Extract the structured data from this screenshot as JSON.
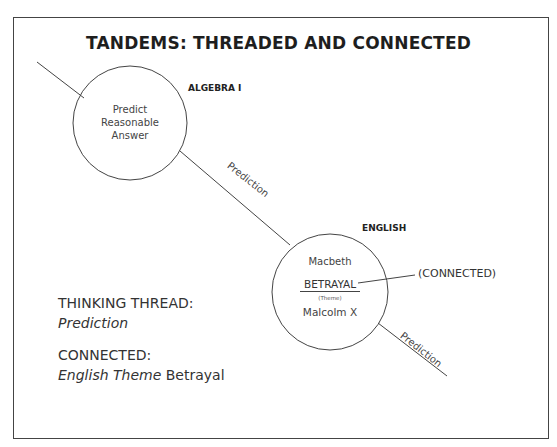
{
  "title": "TANDEMS: THREADED AND CONNECTED",
  "nodes": [
    {
      "subject": "ALGEBRA I",
      "content": [
        "Predict",
        "Reasonable",
        "Answer"
      ]
    },
    {
      "subject": "ENGLISH",
      "top_text": "Macbeth",
      "theme_word": "BETRAYAL",
      "theme_label": "(Theme)",
      "bottom_text": "Malcolm X"
    }
  ],
  "thread_labels": [
    "Prediction",
    "Prediction"
  ],
  "connected_label": "(CONNECTED)",
  "legend": {
    "thread_heading": "THINKING THREAD:",
    "thread_value": "Prediction",
    "connected_heading": "CONNECTED:",
    "connected_value_italic": "English Theme",
    "connected_value_plain": "Betrayal"
  },
  "colors": {
    "line": "#444444",
    "text": "#2a2a2a",
    "background": "#ffffff"
  }
}
